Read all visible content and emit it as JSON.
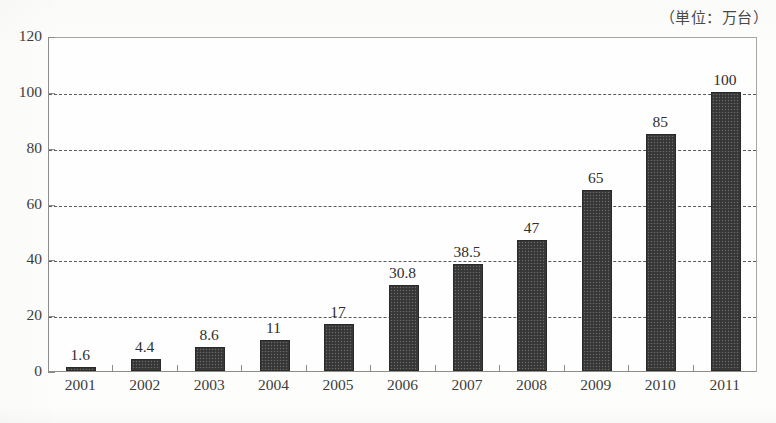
{
  "chart_data": {
    "type": "bar",
    "title": "",
    "subtitle": "",
    "unit_note": "（単位：万台）",
    "xlabel": "",
    "ylabel": "",
    "categories": [
      "2001",
      "2002",
      "2003",
      "2004",
      "2005",
      "2006",
      "2007",
      "2008",
      "2009",
      "2010",
      "2011"
    ],
    "values": [
      1.6,
      4.4,
      8.6,
      11,
      17,
      30.8,
      38.5,
      47,
      65,
      85,
      100
    ],
    "value_labels": [
      "1.6",
      "4.4",
      "8.6",
      "11",
      "17",
      "30.8",
      "38.5",
      "47",
      "65",
      "85",
      "100"
    ],
    "ylim": [
      0,
      120
    ],
    "ytick_values": [
      0,
      20,
      40,
      60,
      80,
      100,
      120
    ],
    "ytick_labels": [
      "0",
      "20",
      "40",
      "60",
      "80",
      "100",
      "120"
    ],
    "grid": true,
    "grid_axis": "y",
    "grid_style": "dashed",
    "legend": null,
    "legend_position": "none",
    "bar_color": "#3c3c3c",
    "axis_color": "#8c8c8c",
    "text_color": "#3d3d3d",
    "background_color": "#fdfdfc",
    "annotations": [
      "（単位：万台）"
    ]
  }
}
